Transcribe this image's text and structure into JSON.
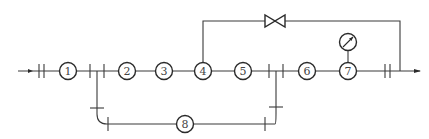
{
  "diagram": {
    "type": "piping-flow-schematic",
    "flow_direction": "left-to-right",
    "colors": {
      "line": "#3a3a3a",
      "background": "#ffffff"
    },
    "main_line": {
      "nodes": [
        {
          "id": "1",
          "label": "1"
        },
        {
          "id": "2",
          "label": "2"
        },
        {
          "id": "3",
          "label": "3"
        },
        {
          "id": "4",
          "label": "4"
        },
        {
          "id": "5",
          "label": "5"
        },
        {
          "id": "6",
          "label": "6"
        },
        {
          "id": "7",
          "label": "7"
        }
      ]
    },
    "bypass_loop_node": {
      "id": "8",
      "label": "8"
    },
    "bypass_valve": {
      "icon": "gate-valve-icon",
      "from": "4",
      "to": "outlet"
    },
    "gauge": {
      "icon": "pressure-gauge-icon",
      "attached_to": "7"
    },
    "inlet_arrow": "arrow-right-icon",
    "outlet_arrow": "arrow-right-icon"
  }
}
